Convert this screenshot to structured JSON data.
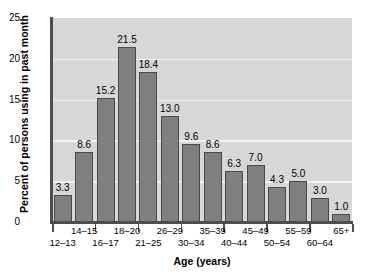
{
  "chart_data": {
    "type": "bar",
    "title": "",
    "subtitle": "",
    "xlabel": "Age (years)",
    "ylabel": "Percent of persons using in past month",
    "categories": [
      "12–13",
      "14–15",
      "16–17",
      "18–20",
      "21–25",
      "26–29",
      "30–34",
      "35–39",
      "40–44",
      "45–49",
      "50–54",
      "55–59",
      "60–64",
      "65+"
    ],
    "values": [
      3.3,
      8.6,
      15.2,
      21.5,
      18.4,
      13.0,
      9.6,
      8.6,
      6.3,
      7.0,
      4.3,
      5.0,
      3.0,
      1.0
    ],
    "value_labels": [
      "3.3",
      "8.6",
      "15.2",
      "21.5",
      "18.4",
      "13.0",
      "9.6",
      "8.6",
      "6.3",
      "7.0",
      "4.3",
      "5.0",
      "3.0",
      "1.0"
    ],
    "ylim": [
      0,
      25
    ],
    "yticks": [
      0,
      5,
      10,
      15,
      20,
      25
    ],
    "ytick_labels": [
      "0",
      "5",
      "10",
      "15",
      "20",
      "25"
    ],
    "grid": "horizontal",
    "legend": "none",
    "bar_color": "#7f7f7f",
    "bar_edge_color": "#4a4a4a",
    "plot_background": "#d7d7d7",
    "gridline_color": "#f2f2f2",
    "axis_color": "#4d4d4d",
    "text_color": "#000000",
    "page_background": "#ffffff",
    "label_rows": [
      {
        "row": "bottom",
        "labels": [
          "12–13",
          "16–17",
          "21–25",
          "30–34",
          "40–44",
          "50–54",
          "60–64"
        ]
      },
      {
        "row": "top",
        "labels": [
          "14–15",
          "18–20",
          "26–29",
          "35–39",
          "45–49",
          "55–59",
          "65+"
        ]
      }
    ]
  }
}
